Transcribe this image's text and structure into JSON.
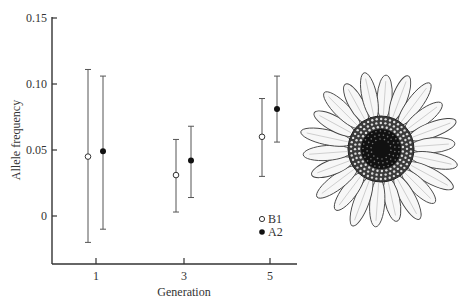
{
  "chart_data": {
    "type": "scatter",
    "subtype": "error-bar",
    "title": "",
    "xlabel": "Generation",
    "ylabel": "Allele frequency",
    "x_ticks": [
      "1",
      "3",
      "5"
    ],
    "y_ticks": [
      "0",
      "0.05",
      "0.10",
      "0.15"
    ],
    "ylim": [
      -0.035,
      0.15
    ],
    "grid": false,
    "legend_position": "inside-lower-right",
    "series": [
      {
        "name": "B1",
        "marker": "open-circle",
        "x": [
          1,
          3,
          5
        ],
        "values": [
          0.045,
          0.031,
          0.06
        ],
        "upper": [
          0.111,
          0.058,
          0.089
        ],
        "lower": [
          -0.02,
          0.003,
          0.03
        ]
      },
      {
        "name": "A2",
        "marker": "filled-circle",
        "x": [
          1,
          3,
          5
        ],
        "values": [
          0.049,
          0.042,
          0.081
        ],
        "upper": [
          0.106,
          0.068,
          0.106
        ],
        "lower": [
          -0.01,
          0.014,
          0.056
        ]
      }
    ],
    "annotations": [
      "illustration of a daisy-like flower (right side)"
    ]
  },
  "legend": {
    "items": [
      {
        "label": "B1",
        "marker": "open-circle"
      },
      {
        "label": "A2",
        "marker": "filled-circle"
      }
    ]
  },
  "colors": {
    "axis": "#333333",
    "errorbar": "#555555",
    "marker_fill_A2": "#111111",
    "marker_fill_B1": "#ffffff"
  }
}
